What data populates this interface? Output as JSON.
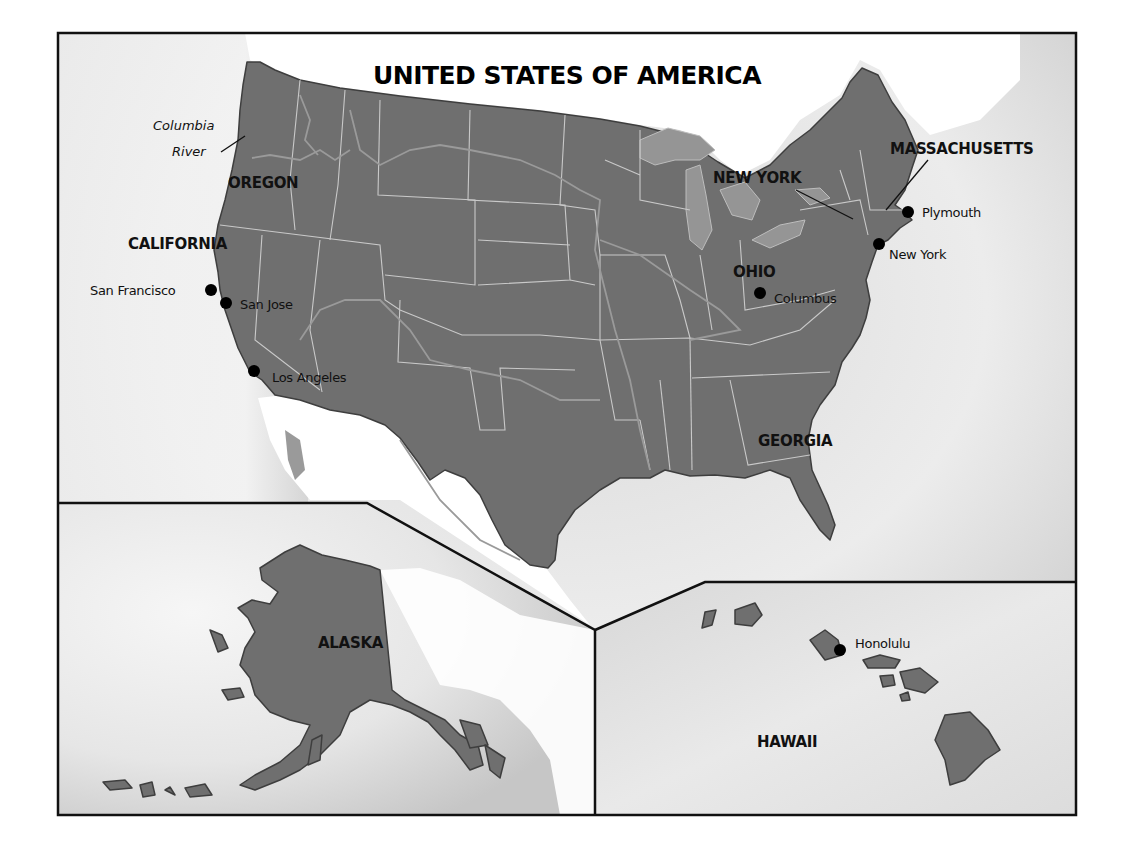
{
  "title": "UNITED STATES OF AMERICA",
  "colors": {
    "land": "#6f6f6f",
    "ocean_light": "#f4f4f4",
    "ocean_shade": "#c8c8c8",
    "lake": "#959595",
    "border": "#c9c9c9",
    "frame": "#111111",
    "text": "#111111"
  },
  "features": {
    "river": {
      "line1": "Columbia",
      "line2": "River"
    }
  },
  "states": {
    "oregon": "OREGON",
    "california": "CALIFORNIA",
    "new_york": "NEW YORK",
    "massachusetts": "MASSACHUSETTS",
    "ohio": "OHIO",
    "georgia": "GEORGIA",
    "alaska": "ALASKA",
    "hawaii": "HAWAII"
  },
  "cities": {
    "san_francisco": "San Francisco",
    "san_jose": "San Jose",
    "los_angeles": "Los Angeles",
    "columbus": "Columbus",
    "plymouth": "Plymouth",
    "new_york": "New York",
    "honolulu": "Honolulu"
  },
  "insets": [
    {
      "name": "Alaska inset",
      "label": "ALASKA"
    },
    {
      "name": "Hawaii inset",
      "label": "HAWAII"
    }
  ]
}
